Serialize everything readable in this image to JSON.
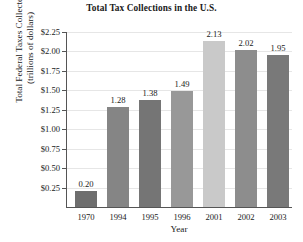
{
  "chart_data": {
    "type": "bar",
    "title": "Total Tax Collections in the U.S.",
    "xlabel": "Year",
    "ylabel": "Total Federal Taxes Collected (trillions of dollars)",
    "ylabel_lines": [
      "Total Federal Taxes Collected",
      "(trillions of dollars)"
    ],
    "categories": [
      "1970",
      "1994",
      "1995",
      "1996",
      "2001",
      "2002",
      "2003"
    ],
    "values": [
      0.2,
      1.28,
      1.38,
      1.49,
      2.13,
      2.02,
      1.95
    ],
    "value_labels": [
      "0.20",
      "1.28",
      "1.38",
      "1.49",
      "2.13",
      "2.02",
      "1.95"
    ],
    "bar_colors": [
      "#6e6e6e",
      "#858585",
      "#757575",
      "#989898",
      "#c9c9c9",
      "#8d8d8d",
      "#797979"
    ],
    "ylim": [
      0,
      2.25
    ],
    "ytick_values": [
      0.25,
      0.5,
      0.75,
      1.0,
      1.25,
      1.5,
      1.75,
      2.0,
      2.25
    ],
    "ytick_labels": [
      "$0.25",
      "$0.50",
      "$0.75",
      "$1.00",
      "$1.25",
      "$1.50",
      "$1.75",
      "$2.00",
      "$2.25"
    ],
    "grid": true,
    "legend": "none",
    "background": "#ffffff",
    "axis_color": "#555555",
    "gridline_color": "#e6e6e6"
  }
}
